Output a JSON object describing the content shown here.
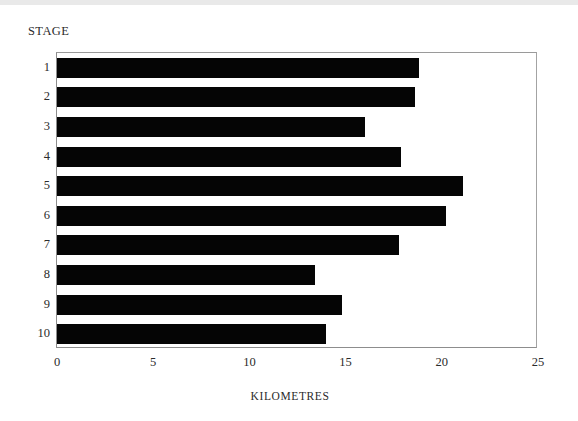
{
  "chart_data": {
    "type": "bar",
    "orientation": "horizontal",
    "title": "",
    "xlabel": "KILOMETRES",
    "ylabel": "STAGE",
    "categories": [
      "1",
      "2",
      "3",
      "4",
      "5",
      "6",
      "7",
      "8",
      "9",
      "10"
    ],
    "values": [
      18.8,
      18.6,
      16.0,
      17.9,
      21.1,
      20.2,
      17.8,
      13.4,
      14.8,
      14.0
    ],
    "xlim": [
      0,
      25
    ],
    "xticks": [
      0,
      5,
      10,
      15,
      20,
      25
    ],
    "xtick_labels": [
      "0",
      "5",
      "10",
      "15",
      "20",
      "25"
    ],
    "grid": false,
    "legend": false,
    "bar_color": "#050505",
    "frame_color": "#8d8d8d",
    "background": "#ffffff"
  },
  "axes": {
    "y_axis_title": "STAGE",
    "x_axis_title": "KILOMETRES"
  },
  "bars": [
    {
      "category": "1",
      "value": 18.8
    },
    {
      "category": "2",
      "value": 18.6
    },
    {
      "category": "3",
      "value": 16.0
    },
    {
      "category": "4",
      "value": 17.9
    },
    {
      "category": "5",
      "value": 21.1
    },
    {
      "category": "6",
      "value": 20.2
    },
    {
      "category": "7",
      "value": 17.8
    },
    {
      "category": "8",
      "value": 13.4
    },
    {
      "category": "9",
      "value": 14.8
    },
    {
      "category": "10",
      "value": 14.0
    }
  ]
}
